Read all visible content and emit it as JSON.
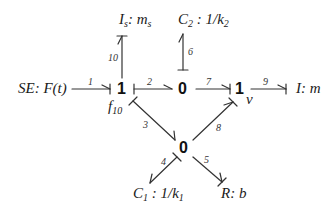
{
  "diagram": {
    "type": "bond-graph",
    "stroke_color": "#333333",
    "elements": {
      "source": {
        "label": "SE: F(t)"
      },
      "inertia_s": {
        "name": "I",
        "sub": "s",
        "sep": ": ",
        "param": "m",
        "param_sub": "s"
      },
      "capacitor_2": {
        "name": "C",
        "sub": "2",
        "sep": " : ",
        "param": "1/k",
        "param_sub": "2"
      },
      "inertia": {
        "label": "I: m"
      },
      "capacitor_1": {
        "name": "C",
        "sub": "1",
        "sep": " : ",
        "param": "1/k",
        "param_sub": "1"
      },
      "resistor": {
        "label": "R: b"
      }
    },
    "junctions": [
      {
        "id": "j1_left",
        "type": "1"
      },
      {
        "id": "j0_top",
        "type": "0"
      },
      {
        "id": "j1_right",
        "type": "1"
      },
      {
        "id": "j0_bottom",
        "type": "0"
      }
    ],
    "variables": {
      "f10": {
        "name": "f",
        "sub": "10"
      },
      "v": "v"
    },
    "bonds": [
      {
        "n": "1",
        "from": "SE",
        "to": "j1_left"
      },
      {
        "n": "2",
        "from": "j1_left",
        "to": "j0_top"
      },
      {
        "n": "3",
        "from": "j1_left",
        "to": "j0_bottom"
      },
      {
        "n": "4",
        "from": "j0_bottom",
        "to": "C1"
      },
      {
        "n": "5",
        "from": "j0_bottom",
        "to": "R"
      },
      {
        "n": "6",
        "from": "j0_top",
        "to": "C2"
      },
      {
        "n": "7",
        "from": "j0_top",
        "to": "j1_right"
      },
      {
        "n": "8",
        "from": "j0_bottom",
        "to": "j1_right"
      },
      {
        "n": "9",
        "from": "j1_right",
        "to": "I"
      },
      {
        "n": "10",
        "from": "j1_left",
        "to": "Is"
      }
    ]
  }
}
